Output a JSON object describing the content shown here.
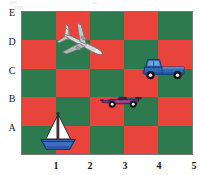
{
  "page": {
    "kind": "coordinate-grid-worksheet",
    "background_color": "#ffffff"
  },
  "grid": {
    "columns": 5,
    "rows": 5,
    "color_a": "#2d7a4f",
    "color_b": "#e8443c",
    "top_left_color": "#2d7a4f",
    "border_color": "#7a7a7a"
  },
  "axes": {
    "y_labels": [
      "E",
      "D",
      "C",
      "B",
      "A"
    ],
    "x_labels": [
      "1",
      "2",
      "3",
      "4",
      "5"
    ]
  },
  "chart_data": {
    "type": "scatter",
    "title": "",
    "xlabel": "",
    "ylabel": "",
    "xlim": [
      0,
      5
    ],
    "ylim": [
      0,
      5
    ],
    "grid": true,
    "legend": "none",
    "x_tick_labels": [
      "1",
      "2",
      "3",
      "4",
      "5"
    ],
    "y_tick_labels": [
      "A",
      "B",
      "C",
      "D",
      "E"
    ],
    "background": "checkerboard 5x5, green #2d7a4f and red #e8443c, top-left green",
    "points": [
      {
        "label": "airplane",
        "icon": "airplane-icon",
        "x": 1.7,
        "y": 4.3,
        "cell": "D2",
        "color": "#cfd3d1"
      },
      {
        "label": "pickup truck",
        "icon": "truck-icon",
        "x": 4.0,
        "y": 3.1,
        "cell": "C4",
        "color": "#2f6bb4"
      },
      {
        "label": "race car",
        "icon": "race-car-icon",
        "x": 2.9,
        "y": 2.0,
        "cell": "B3",
        "color": "#6b3b86"
      },
      {
        "label": "sailboat",
        "icon": "sailboat-icon",
        "x": 1.0,
        "y": 0.9,
        "cell": "A1",
        "color": "#3a6fc4"
      }
    ]
  },
  "objects": {
    "airplane": {
      "name": "airplane",
      "fill": "#c9cdcb",
      "stroke": "#6e7371",
      "shadow": "#9aa09d"
    },
    "truck": {
      "name": "pickup truck",
      "body": "#2f6bb4",
      "dark": "#1d4f8f",
      "window": "#5a93d6",
      "wheel": "#1b1b1b",
      "hub": "#f2f2f2"
    },
    "racecar": {
      "name": "race car",
      "body": "#6b3b86",
      "accent": "#b0457d",
      "wheel": "#151515",
      "hub": "#f2f2f2"
    },
    "sailboat": {
      "name": "sailboat",
      "sail": "#fdfdfd",
      "sail_stroke": "#2a2a2a",
      "hull": "#3a6fc4",
      "hull_stroke": "#16306b",
      "mast": "#2a2a2a"
    }
  }
}
